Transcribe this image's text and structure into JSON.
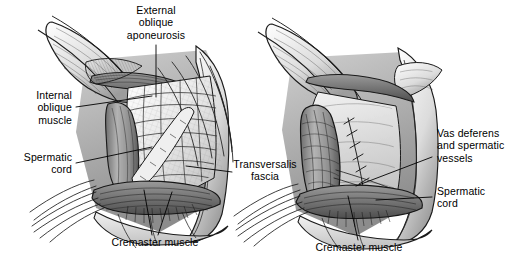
{
  "figure": {
    "background_color": "#ffffff",
    "ink_color": "#000000",
    "style": "grayscale pen-and-ink medical illustration",
    "panels": [
      {
        "id": "left",
        "name": "left-anatomical-view",
        "caption_text": "Dissected inguinal canal with external oblique aponeurosis reflected"
      },
      {
        "id": "right",
        "name": "right-anatomical-view",
        "caption_text": "Spermatic cord mobilized with cremaster muscle divided"
      }
    ]
  },
  "labels": [
    {
      "id": "external-oblique-aponeurosis",
      "text": "External\noblique\naponeurosis",
      "panel": "left",
      "align": "center"
    },
    {
      "id": "internal-oblique-muscle",
      "text": "Internal\noblique\nmuscle",
      "panel": "left",
      "align": "right"
    },
    {
      "id": "spermatic-cord-left",
      "text": "Spermatic\ncord",
      "panel": "left",
      "align": "right"
    },
    {
      "id": "cremaster-muscle-left",
      "text": "Cremaster muscle",
      "panel": "left",
      "align": "center"
    },
    {
      "id": "transversalis-fascia",
      "text": "Transversalis\nfascia",
      "panel": "left",
      "align": "center"
    },
    {
      "id": "vas-deferens-and-spermatic-vessels",
      "text": "Vas deferens\nand spermatic\nvessels",
      "panel": "right",
      "align": "left"
    },
    {
      "id": "spermatic-cord-right",
      "text": "Spermatic\ncord",
      "panel": "right",
      "align": "left"
    },
    {
      "id": "cremaster-muscle-right",
      "text": "Cremaster muscle",
      "panel": "right",
      "align": "center"
    }
  ],
  "palette": {
    "tissue_light": "#e9e9e9",
    "tissue_mid": "#b8b8b8",
    "tissue_dark": "#8a8a8a",
    "tissue_deep": "#636363",
    "shadow": "#3d3d3d",
    "outline": "#1a1a1a",
    "white": "#ffffff"
  }
}
